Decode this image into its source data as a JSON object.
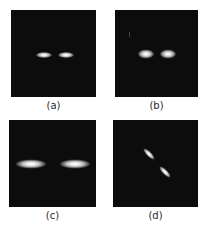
{
  "figure": {
    "background": "#ffffff",
    "panel_background": "#0c0c0c",
    "panels": [
      {
        "id": "a",
        "caption": "(a)",
        "description": "Two small bright horizontally elongated spots, close together",
        "box": {
          "x": 11,
          "y": 10,
          "w": 85,
          "h": 87
        },
        "spots": [
          {
            "cx": 33,
            "cy": 45,
            "w": 16,
            "h": 6,
            "angle": 0
          },
          {
            "cx": 55,
            "cy": 45,
            "w": 16,
            "h": 6,
            "angle": 0
          }
        ]
      },
      {
        "id": "b",
        "caption": "(b)",
        "description": "Two bright rounded spots, slightly larger, close together",
        "box": {
          "x": 115,
          "y": 10,
          "w": 83,
          "h": 87
        },
        "spots": [
          {
            "cx": 31,
            "cy": 44,
            "w": 16,
            "h": 9,
            "angle": 0
          },
          {
            "cx": 53,
            "cy": 44,
            "w": 16,
            "h": 9,
            "angle": 0
          }
        ]
      },
      {
        "id": "c",
        "caption": "(c)",
        "description": "Two wide horizontally elongated spots, far apart",
        "box": {
          "x": 9,
          "y": 120,
          "w": 87,
          "h": 87
        },
        "spots": [
          {
            "cx": 22,
            "cy": 44,
            "w": 30,
            "h": 9,
            "angle": 0
          },
          {
            "cx": 66,
            "cy": 44,
            "w": 30,
            "h": 9,
            "angle": 0
          }
        ]
      },
      {
        "id": "d",
        "caption": "(d)",
        "description": "Two diagonally tilted elongated spots along a 45° line",
        "box": {
          "x": 113,
          "y": 120,
          "w": 85,
          "h": 87
        },
        "spots": [
          {
            "cx": 36,
            "cy": 34,
            "w": 15,
            "h": 5,
            "angle": 45
          },
          {
            "cx": 52,
            "cy": 52,
            "w": 15,
            "h": 5,
            "angle": 45
          }
        ]
      }
    ]
  }
}
